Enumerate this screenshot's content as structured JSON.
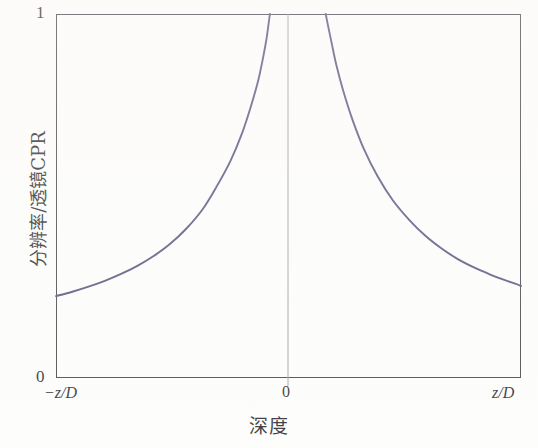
{
  "figure": {
    "background_color": "#fdfdfc",
    "frame_color": "#3b3b42",
    "curve_color": "#4a4a78",
    "center_line_color": "#9a9aa2"
  },
  "axes": {
    "y_tick_top": "1",
    "y_tick_bottom": "0",
    "x_tick_left": "−z/D",
    "x_tick_center": "0",
    "x_tick_right": "z/D",
    "x_title": "深度",
    "y_title": "分辨率/透镜CPR"
  },
  "chart_data": {
    "type": "line",
    "title": "",
    "xlabel": "深度",
    "ylabel": "分辨率/透镜CPR",
    "xlim": [
      -1,
      1
    ],
    "ylim": [
      0,
      1
    ],
    "x_tick_labels": [
      "−z/D",
      "0",
      "z/D"
    ],
    "x_tick_values": [
      -1,
      0,
      1
    ],
    "y_tick_labels": [
      "0",
      "1"
    ],
    "y_tick_values": [
      0,
      1
    ],
    "grid": false,
    "legend": false,
    "annotations": [
      "vertical reference line at x = 0"
    ],
    "series": [
      {
        "name": "CPR left branch",
        "comment": "rises hyperbolically toward 1 as depth approaches 0 from the negative side",
        "x": [
          -1.0,
          -0.93,
          -0.86,
          -0.79,
          -0.72,
          -0.65,
          -0.58,
          -0.51,
          -0.44,
          -0.37,
          -0.31,
          -0.25,
          -0.2,
          -0.16,
          -0.13,
          -0.11,
          -0.095,
          -0.085,
          -0.08
        ],
        "y": [
          0.225,
          0.237,
          0.251,
          0.267,
          0.286,
          0.308,
          0.335,
          0.368,
          0.41,
          0.463,
          0.525,
          0.596,
          0.672,
          0.75,
          0.818,
          0.878,
          0.93,
          0.976,
          1.0
        ]
      },
      {
        "name": "CPR right branch",
        "comment": "mirror image; falls hyperbolically from 1 near depth 0 toward the right edge",
        "x": [
          0.16,
          0.17,
          0.185,
          0.205,
          0.235,
          0.275,
          0.325,
          0.385,
          0.45,
          0.52,
          0.59,
          0.66,
          0.73,
          0.8,
          0.865,
          0.925,
          0.975,
          1.0
        ],
        "y": [
          1.0,
          0.968,
          0.922,
          0.862,
          0.79,
          0.71,
          0.628,
          0.552,
          0.487,
          0.434,
          0.39,
          0.355,
          0.326,
          0.303,
          0.285,
          0.27,
          0.259,
          0.253
        ]
      }
    ]
  }
}
